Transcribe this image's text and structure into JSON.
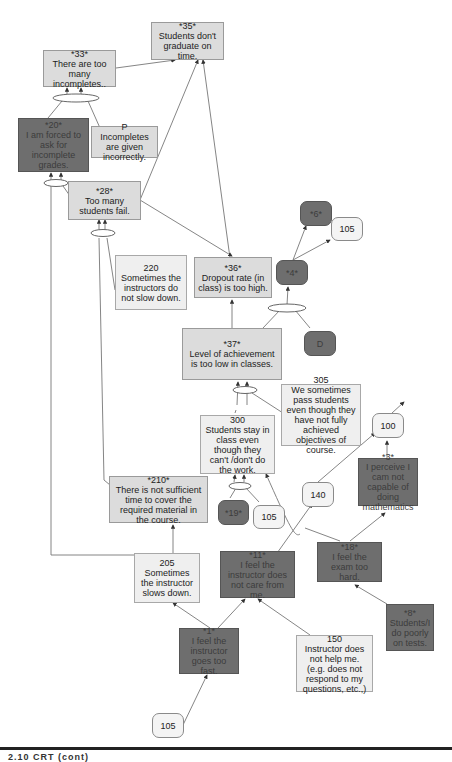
{
  "diagram": {
    "type": "current reality tree",
    "colors": {
      "light_box": "#dcdcdc",
      "pale_box": "#efefef",
      "dark_box": "#6e6e6e",
      "line": "#666666",
      "rule": "#222222"
    },
    "nodes": {
      "n35": {
        "id": "*35*",
        "text": "Students don't graduate on time."
      },
      "n33": {
        "id": "*33*",
        "text": "There are too many incompletes.."
      },
      "n20": {
        "id": "*20*",
        "text": "I am forced to ask for incomplete grades."
      },
      "nP": {
        "id": "P",
        "text": "Incompletes are given incorrectly."
      },
      "n28": {
        "id": "*28*",
        "text": "Too many students fail."
      },
      "n220": {
        "id": "220",
        "text": "Sometimes the instructors do not slow down."
      },
      "n36": {
        "id": "*36*",
        "text": "Dropout rate (in class) is too high."
      },
      "n6": {
        "id": "*6*",
        "text": ""
      },
      "n105a": {
        "id": "105",
        "text": ""
      },
      "n4": {
        "id": "*4*",
        "text": ""
      },
      "nD": {
        "id": "D",
        "text": ""
      },
      "n37": {
        "id": "*37*",
        "text": "Level of achievement is too low in classes."
      },
      "n305": {
        "id": "305",
        "text": "We sometimes pass students even though they have not fully achieved objectives of course."
      },
      "n300": {
        "id": "300",
        "text": "Students stay in class even though they can't /don't do the work."
      },
      "n100": {
        "id": "100",
        "text": ""
      },
      "n3": {
        "id": "*3*",
        "text": "I perceive I cam not capable of doing mathematics"
      },
      "n210": {
        "id": "*210*",
        "text": "There is not sufficient time to cover the required material in the course."
      },
      "n19": {
        "id": "*19*",
        "text": ""
      },
      "n105b": {
        "id": "105",
        "text": ""
      },
      "n140": {
        "id": "140",
        "text": ""
      },
      "n18": {
        "id": "*18*",
        "text": "I feel the exam too hard."
      },
      "n205": {
        "id": "205",
        "text": "Sometimes the instructor slows down."
      },
      "n11": {
        "id": "*11*",
        "text": "I feel the instructor does not care from me."
      },
      "n8": {
        "id": "*8*",
        "text": "Students/I do poorly on tests."
      },
      "n1": {
        "id": "*1*",
        "text": "I feel the instructor goes too fast."
      },
      "n150": {
        "id": "150",
        "text": "Instructor does not help me. (e.g. does not respond to my questions, etc.,)"
      },
      "n105c": {
        "id": "105",
        "text": ""
      }
    },
    "caption": "2.10 CRT (cont)"
  }
}
